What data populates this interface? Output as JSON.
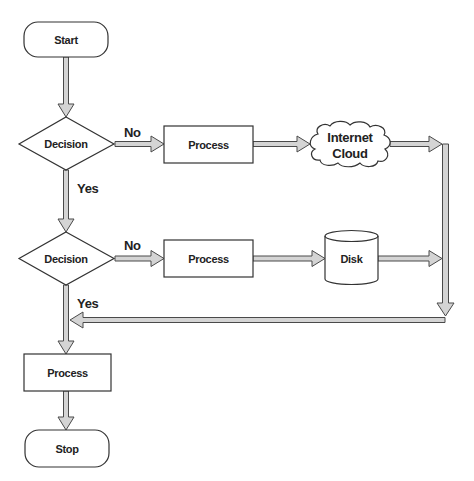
{
  "diagram": {
    "type": "flowchart",
    "colors": {
      "shape_fill": "#ffffff",
      "shape_stroke": "#333333",
      "arrow_fill": "#d4d4d4",
      "arrow_stroke": "#4a4a4a",
      "text": "#222222"
    },
    "nodes": {
      "start": {
        "shape": "terminator",
        "label": "Start"
      },
      "decision_1": {
        "shape": "diamond",
        "label": "Decision"
      },
      "process_1": {
        "shape": "rectangle",
        "label": "Process"
      },
      "cloud": {
        "shape": "cloud",
        "label_line1": "Internet",
        "label_line2": "Cloud"
      },
      "decision_2": {
        "shape": "diamond",
        "label": "Decision"
      },
      "process_2": {
        "shape": "rectangle",
        "label": "Process"
      },
      "disk": {
        "shape": "cylinder",
        "label": "Disk"
      },
      "process_3": {
        "shape": "rectangle",
        "label": "Process"
      },
      "stop": {
        "shape": "terminator",
        "label": "Stop"
      }
    },
    "edge_labels": {
      "decision_1_no": "No",
      "decision_1_yes": "Yes",
      "decision_2_no": "No",
      "decision_2_yes": "Yes"
    },
    "edges": [
      {
        "from": "start",
        "to": "decision_1"
      },
      {
        "from": "decision_1",
        "to": "process_1",
        "label": "No"
      },
      {
        "from": "process_1",
        "to": "cloud"
      },
      {
        "from": "cloud",
        "to": "right-connector"
      },
      {
        "from": "decision_1",
        "to": "decision_2",
        "label": "Yes"
      },
      {
        "from": "decision_2",
        "to": "process_2",
        "label": "No"
      },
      {
        "from": "process_2",
        "to": "disk"
      },
      {
        "from": "disk",
        "to": "right-connector"
      },
      {
        "from": "right-connector",
        "to": "main-line-return"
      },
      {
        "from": "decision_2",
        "to": "process_3",
        "label": "Yes"
      },
      {
        "from": "process_3",
        "to": "stop"
      }
    ]
  }
}
